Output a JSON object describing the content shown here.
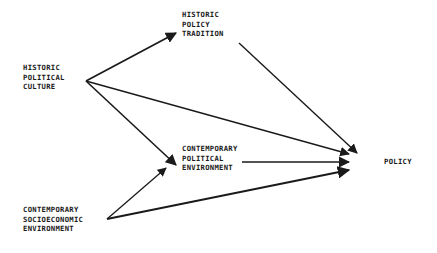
{
  "diagram": {
    "title": "",
    "nodes": [
      {
        "id": "historic_political_culture",
        "lines": [
          "HISTORIC",
          "POLITICAL",
          "CULTURE"
        ]
      },
      {
        "id": "historic_policy_tradition",
        "lines": [
          "HISTORIC",
          "POLICY",
          "TRADITION"
        ]
      },
      {
        "id": "contemporary_political_environment",
        "lines": [
          "CONTEMPORARY",
          "POLITICAL",
          "ENVIRONMENT"
        ]
      },
      {
        "id": "contemporary_socioeconomic_environment",
        "lines": [
          "CONTEMPORARY",
          "SOCIOECONOMIC",
          "ENVIRONMENT"
        ]
      },
      {
        "id": "policy",
        "lines": [
          "POLICY"
        ]
      }
    ],
    "edges": [
      {
        "from": "historic_political_culture",
        "to": "historic_policy_tradition"
      },
      {
        "from": "historic_political_culture",
        "to": "contemporary_political_environment"
      },
      {
        "from": "historic_political_culture",
        "to": "policy"
      },
      {
        "from": "historic_policy_tradition",
        "to": "policy"
      },
      {
        "from": "contemporary_political_environment",
        "to": "policy"
      },
      {
        "from": "contemporary_socioeconomic_environment",
        "to": "contemporary_political_environment"
      },
      {
        "from": "contemporary_socioeconomic_environment",
        "to": "policy"
      }
    ],
    "colors": {
      "ink": "#1a1a1a",
      "background": "#ffffff"
    }
  }
}
